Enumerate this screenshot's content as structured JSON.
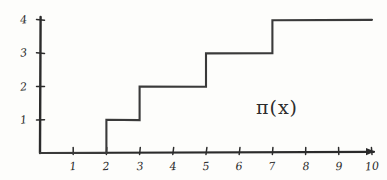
{
  "chart_data": {
    "type": "line",
    "subtype": "step",
    "title": "",
    "xlabel": "",
    "ylabel": "",
    "annotations": [
      {
        "text": "π(x)",
        "x": 8.3,
        "y": 1.6,
        "name": "pi-of-x-label"
      }
    ],
    "xlim": [
      0,
      10.4
    ],
    "ylim": [
      0,
      4.3
    ],
    "grid": false,
    "legend": null,
    "x_ticks": [
      1,
      2,
      3,
      4,
      5,
      6,
      7,
      8,
      9,
      10
    ],
    "x_tick_labels": [
      "1",
      "2",
      "3",
      "4",
      "5",
      "6",
      "7",
      "8",
      "9",
      "10"
    ],
    "y_ticks": [
      1,
      2,
      3,
      4
    ],
    "y_tick_labels": [
      "1",
      "2",
      "3",
      "4"
    ],
    "series": [
      {
        "name": "π(x)",
        "x": [
          0,
          2,
          2,
          3,
          3,
          5,
          5,
          7,
          7,
          10
        ],
        "values": [
          0,
          0,
          1,
          1,
          2,
          2,
          3,
          3,
          4,
          4
        ],
        "steps": [
          {
            "from_x": 0,
            "to_x": 2,
            "level": 0
          },
          {
            "from_x": 2,
            "to_x": 3,
            "level": 1
          },
          {
            "from_x": 3,
            "to_x": 5,
            "level": 2
          },
          {
            "from_x": 5,
            "to_x": 7,
            "level": 3
          },
          {
            "from_x": 7,
            "to_x": 10,
            "level": 4
          }
        ],
        "jump_points": [
          2,
          3,
          5,
          7
        ],
        "color": "#3a3a3a"
      }
    ]
  },
  "style": {
    "background": "#fdfdfb",
    "ink": "#2f2f2f",
    "axis_color": "#2b2b2b",
    "curve_color": "#3a3a3a"
  },
  "geometry": {
    "origin_x": 40,
    "origin_y": 153,
    "x_step_px": 33.2,
    "y_step_px": 33.2,
    "axis_top_y": 17,
    "axis_right_x": 374
  }
}
